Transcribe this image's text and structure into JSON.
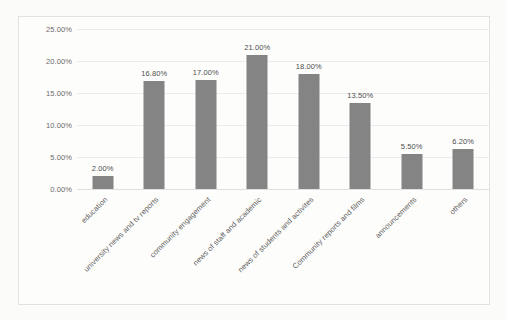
{
  "scan": {
    "top_remnant": "·   ·   ·      ·"
  },
  "chart_data": {
    "type": "bar",
    "title": "",
    "subtitle": "",
    "xlabel": "",
    "ylabel": "",
    "ylim": [
      0,
      25
    ],
    "ytick_labels": [
      "0.00%",
      "5.00%",
      "10.00%",
      "15.00%",
      "20.00%",
      "25.00%"
    ],
    "ytick_values": [
      0,
      5,
      10,
      15,
      20,
      25
    ],
    "grid": true,
    "legend": false,
    "legend_position": "none",
    "bar_color": "#848484",
    "gridline_color": "#ececec",
    "categories": [
      "education",
      "university news and tv reports",
      "community engagement",
      "news of staff and academic",
      "news of students and activites",
      "Community reports and films",
      "announcements",
      "others"
    ],
    "values": [
      2.0,
      16.8,
      17.0,
      21.0,
      18.0,
      13.5,
      5.5,
      6.2
    ],
    "data_labels": [
      "2.00%",
      "16.80%",
      "17.00%",
      "21.00%",
      "18.00%",
      "13.50%",
      "5.50%",
      "6.20%"
    ]
  }
}
